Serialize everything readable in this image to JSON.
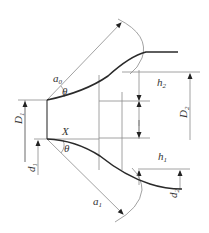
{
  "diagram": {
    "title": "",
    "labels": {
      "a0": {
        "main": "a",
        "sub": "0"
      },
      "a1": {
        "main": "a",
        "sub": "1"
      },
      "theta_top": {
        "main": "θ"
      },
      "theta_bottom": {
        "main": "θ"
      },
      "X": {
        "main": "X"
      },
      "D1": {
        "main": "D",
        "sub": "1"
      },
      "D2": {
        "main": "D",
        "sub": "2"
      },
      "d1": {
        "main": "d",
        "sub": "1"
      },
      "d2": {
        "main": "d",
        "sub": "2"
      },
      "h1": {
        "main": "h",
        "sub": "1"
      },
      "h2": {
        "main": "h",
        "sub": "2"
      }
    },
    "colors": {
      "profile": "#2a2a2a",
      "dimension": "#8a8a8a",
      "text": "#333333"
    }
  }
}
